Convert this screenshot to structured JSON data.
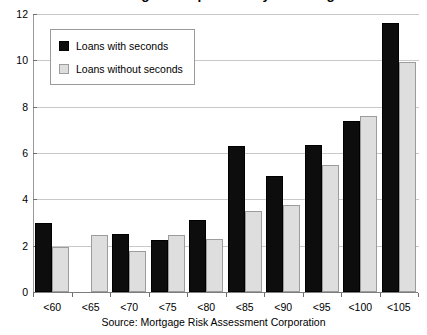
{
  "chart_data": {
    "type": "bar",
    "title": "Percentage Delinquencies by LTV Range",
    "xlabel": "",
    "ylabel": "",
    "ylim": [
      0,
      12
    ],
    "yticks": [
      0,
      2,
      4,
      6,
      8,
      10,
      12
    ],
    "grid": true,
    "legend_position": "upper-left",
    "categories": [
      "<60",
      "<65",
      "<70",
      "<75",
      "<80",
      "<85",
      "<90",
      "<95",
      "<100",
      "<105"
    ],
    "series": [
      {
        "name": "Loans with seconds",
        "color": "#0d0d0d",
        "values": [
          3.0,
          0,
          2.5,
          2.25,
          3.1,
          6.3,
          5.0,
          6.35,
          7.4,
          11.6
        ]
      },
      {
        "name": "Loans without seconds",
        "color": "#dedede",
        "values": [
          1.95,
          2.45,
          1.75,
          2.45,
          2.3,
          3.5,
          3.75,
          5.5,
          7.6,
          9.95
        ]
      }
    ],
    "annotations": [
      "Source: Mortgage Risk Assessment Corporation"
    ]
  },
  "source_note": "Source: Mortgage Risk Assessment Corporation"
}
